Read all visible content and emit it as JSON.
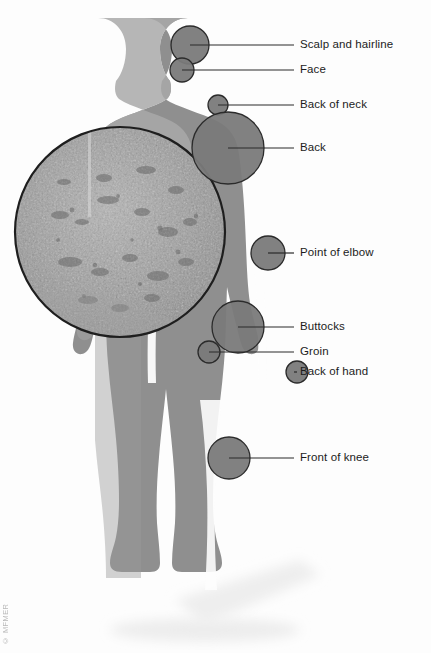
{
  "figure": {
    "inset": {
      "name": "psoriasis-skin-closeup",
      "shape": "circle",
      "description": "Magnified circular photograph of psoriasis plaques on skin"
    }
  },
  "colors": {
    "background": "#fdfdfd",
    "body_fill": "#8f8f8f",
    "body_highlight": "#a8a8a8",
    "marker_fill": "#7a7a7a",
    "marker_stroke": "#2b2b2b",
    "leader_line": "#2b2b2b",
    "text": "#1c1c1c",
    "shadow": "#e4e4e4",
    "credit_text": "#b9b9b9"
  },
  "credit": {
    "text": "© MFMER"
  },
  "markers": [
    {
      "id": "scalp-and-hairline",
      "label": "Scalp and hairline",
      "cx": 190,
      "cy": 45,
      "r": 19,
      "leader_x2": 294,
      "text_x": 300,
      "text_y": 45
    },
    {
      "id": "face",
      "label": "Face",
      "cx": 182,
      "cy": 70,
      "r": 12,
      "leader_x2": 294,
      "text_x": 300,
      "text_y": 70
    },
    {
      "id": "back-of-neck",
      "label": "Back of neck",
      "cx": 218,
      "cy": 105,
      "r": 10,
      "leader_x2": 294,
      "text_x": 300,
      "text_y": 105
    },
    {
      "id": "back",
      "label": "Back",
      "cx": 228,
      "cy": 148,
      "r": 36,
      "leader_x2": 294,
      "text_x": 300,
      "text_y": 148
    },
    {
      "id": "point-of-elbow",
      "label": "Point of elbow",
      "cx": 268,
      "cy": 253,
      "r": 17,
      "leader_x2": 294,
      "text_x": 300,
      "text_y": 253
    },
    {
      "id": "buttocks",
      "label": "Buttocks",
      "cx": 238,
      "cy": 327,
      "r": 26,
      "leader_x2": 294,
      "text_x": 300,
      "text_y": 327
    },
    {
      "id": "groin",
      "label": "Groin",
      "cx": 209,
      "cy": 352,
      "r": 11,
      "leader_x2": 294,
      "text_x": 300,
      "text_y": 352
    },
    {
      "id": "back-of-hand",
      "label": "Back of hand",
      "cx": 297,
      "cy": 372,
      "r": 11,
      "leader_x2": 294,
      "text_x": 300,
      "text_y": 372
    },
    {
      "id": "front-of-knee",
      "label": "Front of knee",
      "cx": 229,
      "cy": 458,
      "r": 21,
      "leader_x2": 294,
      "text_x": 300,
      "text_y": 458
    }
  ]
}
